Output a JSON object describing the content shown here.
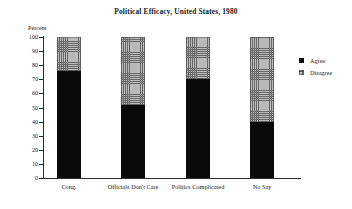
{
  "chart_data": {
    "type": "bar",
    "stacked": true,
    "title": "Political Efficacy, United States, 1980",
    "xlabel": "",
    "ylabel": "Percent",
    "ylim": [
      0,
      100
    ],
    "yticks": [
      0,
      10,
      20,
      30,
      40,
      50,
      60,
      70,
      80,
      90,
      100
    ],
    "ytick_labels": [
      "0",
      "10",
      "20",
      "30",
      "40",
      "50",
      "60",
      "70",
      "80",
      "90",
      "100"
    ],
    "grid": false,
    "legend_position": "right",
    "categories": [
      "Cong.",
      "Officials Don't Care",
      "Politics Complicated",
      "No Say"
    ],
    "series": [
      {
        "name": "Agree",
        "color": "#0a0a0a",
        "values": [
          76,
          52,
          70,
          40
        ]
      },
      {
        "name": "Disagree",
        "color": "#b9b9b9",
        "values": [
          24,
          48,
          30,
          60
        ]
      }
    ]
  },
  "legend": {
    "entries": [
      {
        "label": "Agree",
        "swatch": "solid-black-square-icon"
      },
      {
        "label": "Disagree",
        "swatch": "hatched-gray-square-icon"
      }
    ]
  }
}
